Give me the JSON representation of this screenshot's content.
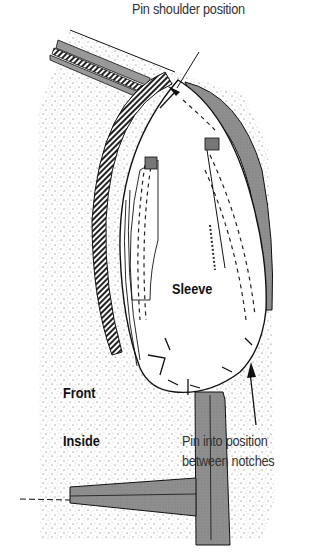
{
  "diagram": {
    "type": "sewing-illustration",
    "labels": {
      "pin_shoulder": "Pin shoulder position",
      "sleeve": "Sleeve",
      "front": "Front",
      "inside": "Inside",
      "pin_notches_line1": "Pin into position",
      "pin_notches_line2": "between notches"
    },
    "colors": {
      "ink": "#111111",
      "shade": "#8a8a8a",
      "paper": "#ffffff",
      "speckle": "#555555"
    }
  }
}
